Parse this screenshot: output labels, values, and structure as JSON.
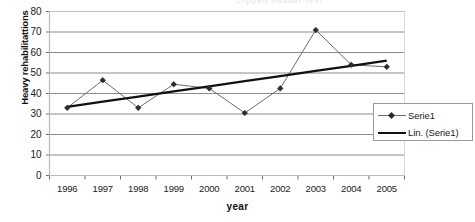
{
  "chart_data": {
    "type": "line",
    "title": "",
    "xlabel": "year",
    "ylabel": "Heavy rehabilitattions",
    "categories": [
      "1996",
      "1997",
      "1998",
      "1999",
      "2000",
      "2001",
      "2002",
      "2003",
      "2004",
      "2005"
    ],
    "x": [
      1996,
      1997,
      1998,
      1999,
      2000,
      2001,
      2002,
      2003,
      2004,
      2005
    ],
    "ylim": [
      0,
      80
    ],
    "ytick_labels": [
      "80",
      "70",
      "60",
      "50",
      "40",
      "30",
      "20",
      "10",
      "0"
    ],
    "yticks": [
      80,
      70,
      60,
      50,
      40,
      30,
      20,
      10,
      0
    ],
    "grid": "horizontal",
    "legend_position": "right-inside",
    "series": [
      {
        "name": "Serie1",
        "type": "line-markers",
        "marker": "diamond",
        "color": "#6d6d6d",
        "values": [
          33,
          46.5,
          33,
          44.5,
          42.5,
          30.5,
          42.5,
          71,
          54,
          53
        ]
      },
      {
        "name": "Lin. (Serie1)",
        "type": "trendline",
        "color": "#111111",
        "values": [
          33.5,
          36,
          38.5,
          41,
          43.5,
          46,
          48.5,
          51,
          53.5,
          56
        ]
      }
    ]
  },
  "legend": {
    "items": [
      {
        "label": "Serie1",
        "key": "diamond-marker-line"
      },
      {
        "label": "Lin. (Serie1)",
        "key": "thick-line"
      }
    ]
  },
  "axes": {
    "y_title": "Heavy rehabilitattions",
    "x_title": "year"
  },
  "clipped_title": "clipped header text",
  "colors": {
    "series_line": "#6d6d6d",
    "marker": "#2b2b2b",
    "trendline": "#111111",
    "gridline": "#808080",
    "axis": "#6b6b6b",
    "legend_border": "#9a9a9a",
    "background": "#ffffff"
  }
}
